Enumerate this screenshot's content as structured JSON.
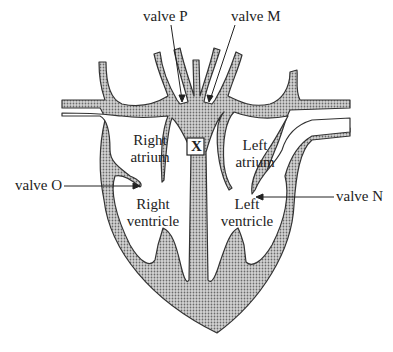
{
  "diagram": {
    "type": "heart-cross-section",
    "colors": {
      "tissue_fill": "#b8b8b8",
      "outline": "#333333",
      "background": "#ffffff",
      "text": "#222222"
    },
    "chambers": {
      "right_atrium": {
        "line1": "Right",
        "line2": "atrium"
      },
      "left_atrium": {
        "line1": "Left",
        "line2": "atrium"
      },
      "right_ventricle": {
        "line1": "Right",
        "line2": "ventricle"
      },
      "left_ventricle": {
        "line1": "Left",
        "line2": "ventricle"
      }
    },
    "valves": {
      "p": "valve P",
      "m": "valve M",
      "o": "valve O",
      "n": "valve N"
    },
    "marker": {
      "label": "X"
    }
  }
}
